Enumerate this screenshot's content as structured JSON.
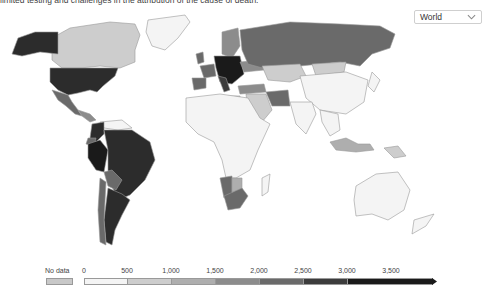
{
  "header": {
    "note_text": "limited testing and challenges in the attribution of the cause of death."
  },
  "region_selector": {
    "selected": "World",
    "icon": "chevron-down-icon"
  },
  "map": {
    "type": "choropleth",
    "projection": "world",
    "shading": {
      "very_high": [
        "United States",
        "Alaska",
        "Peru",
        "Brazil",
        "Colombia",
        "Argentina",
        "Central Europe"
      ],
      "high": [
        "Russia",
        "Mexico",
        "Chile",
        "Bolivia",
        "Ecuador",
        "Spain",
        "France",
        "Italy",
        "Iran",
        "South Africa",
        "Namibia"
      ],
      "medium": [
        "United Kingdom",
        "Scandinavia",
        "Ukraine",
        "Turkey",
        "Botswana",
        "Indonesia",
        "Libya"
      ],
      "low": [
        "Canada",
        "Kazakhstan",
        "Mongolia",
        "Middle East",
        "Papua New Guinea"
      ],
      "very_low": [
        "Greenland",
        "China",
        "India",
        "Africa",
        "Australia",
        "Southeast Asia",
        "Venezuela"
      ]
    }
  },
  "legend": {
    "no_data_label": "No data",
    "no_data_color": "#c8c8c8",
    "ticks": [
      "0",
      "500",
      "1,000",
      "1,500",
      "2,000",
      "2,500",
      "3,000",
      "3,500"
    ],
    "bins": [
      {
        "from": 0,
        "to": 500,
        "color": "#f4f4f4"
      },
      {
        "from": 500,
        "to": 1000,
        "color": "#cdcdcd"
      },
      {
        "from": 1000,
        "to": 1500,
        "color": "#aeaeae"
      },
      {
        "from": 1500,
        "to": 2000,
        "color": "#8c8c8c"
      },
      {
        "from": 2000,
        "to": 2500,
        "color": "#6a6a6a"
      },
      {
        "from": 2500,
        "to": 3000,
        "color": "#3c3c3c"
      },
      {
        "from": 3000,
        "to": 3500,
        "color": "#2c2c2c"
      },
      {
        "from": 3500,
        "to": null,
        "color": "#1a1a1a"
      }
    ]
  }
}
